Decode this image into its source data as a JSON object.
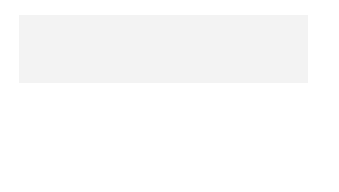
{
  "map": {
    "colors": {
      "frame": "#555555",
      "land_states": "#d4d4d4",
      "texas": "#bdbdbd",
      "mexico": "#f2f2f2",
      "water": "#f8f8f8",
      "border": "#555555",
      "river": "#8a8a8a"
    },
    "states": {
      "arizona": "ARIZONA",
      "new_mexico": "NEW MEXICO",
      "oklahoma": "OKLAHOMA",
      "arkansas": "ARKANSAS",
      "texas": "TEXAS",
      "louisiana": "LOUISIANA",
      "mississippi": "MISS."
    },
    "countries": {
      "mexico": "MEXICO"
    },
    "water_bodies": {
      "gulf_line1": "GULF OF",
      "gulf_line2": "MEXICO"
    },
    "city": {
      "name": "DALLAS"
    },
    "rivers": {
      "red_1": "Red",
      "red_2": "R.",
      "rio_grande": "Rio Grande",
      "mississippi": "Mississippi",
      "mississippi_r": "R."
    },
    "graticule": {
      "lon_110_top": "110°W",
      "lon_100_top": "100°W",
      "lon_90_top": "90°W",
      "lat_30_left": "30°N",
      "lat_30_right": "30°N",
      "lon_110_bottom": "110°W",
      "lon_100_bottom": "100°W",
      "lon_90_bottom": "90°W"
    },
    "scale_bar": {
      "mi_zero": "0",
      "mi_label": "200 mi",
      "km_zero": "0",
      "km_label": "200 km"
    }
  }
}
